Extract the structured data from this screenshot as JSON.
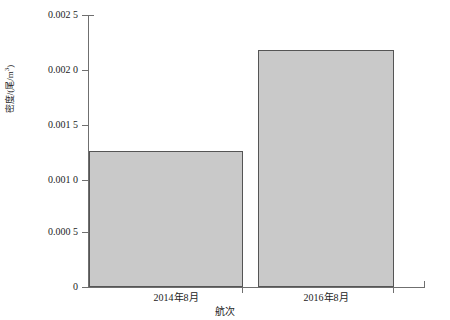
{
  "chart_data": {
    "type": "bar",
    "title": "",
    "subtitle": "",
    "categories": [
      "2014年8月",
      "2016年8月"
    ],
    "values": [
      0.00125,
      0.00218
    ],
    "series": [
      {
        "name": "密度",
        "values": [
          0.00125,
          0.00218
        ]
      }
    ],
    "xlabel": "航次",
    "ylabel": "密度/(尾/m³)",
    "ylabel_main": "密度/(尾/m",
    "ylabel_sup": "3",
    "ylabel_tail": ")",
    "ylim": [
      0,
      0.0025
    ],
    "xlim": [
      0,
      2
    ],
    "grid": false,
    "legend": false,
    "legend_position": "none",
    "ytick_values": [
      0,
      0.0005,
      0.001,
      0.0015,
      0.002,
      0.0025
    ],
    "ytick_labels": [
      "0",
      "0.000 5",
      "0.001 0",
      "0.001 5",
      "0.002 0",
      "0.002 5"
    ],
    "bar_fill_color": "#c9c9c9",
    "bar_edge_color": "#555555",
    "axis_color": "#6f6f6f",
    "background_color": "#ffffff"
  }
}
